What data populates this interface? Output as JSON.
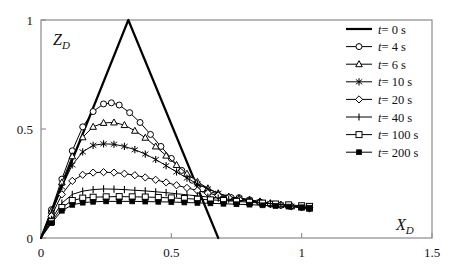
{
  "chart_data": {
    "type": "line",
    "title": "",
    "xlabel": "X_D",
    "ylabel": "Z_D",
    "xlim": [
      0,
      1.5
    ],
    "ylim": [
      0,
      1
    ],
    "xticks": [
      0,
      0.5,
      1,
      1.5
    ],
    "xticklabels": [
      "0",
      "0.5",
      "1",
      "1.5"
    ],
    "yticks": [
      0,
      0.5,
      1
    ],
    "yticklabels": [
      "0",
      "0.5",
      "1"
    ],
    "grid": false,
    "legend_position": "upper right",
    "series": [
      {
        "name": "t=0 s",
        "label": "t = 0 s",
        "marker": "none",
        "color": "#000000",
        "linewidth": 2.2,
        "x": [
          0,
          0.335,
          0.68
        ],
        "y": [
          0,
          1.0,
          0
        ]
      },
      {
        "name": "t=4 s",
        "label": "t = 4 s",
        "marker": "circle",
        "color": "#000000",
        "linewidth": 1.0,
        "x": [
          0,
          0.04,
          0.08,
          0.12,
          0.16,
          0.2,
          0.24,
          0.27,
          0.3,
          0.34,
          0.38,
          0.42,
          0.46,
          0.5,
          0.54,
          0.58,
          0.62,
          0.66,
          0.7,
          0.73,
          0.76,
          0.8,
          0.84,
          0.88,
          0.92,
          0.96,
          1.0,
          1.03
        ],
        "y": [
          0,
          0.13,
          0.27,
          0.4,
          0.51,
          0.58,
          0.615,
          0.62,
          0.61,
          0.575,
          0.53,
          0.475,
          0.42,
          0.365,
          0.31,
          0.265,
          0.225,
          0.195,
          0.18,
          0.185,
          0.185,
          0.175,
          0.165,
          0.155,
          0.15,
          0.145,
          0.14,
          0.135
        ]
      },
      {
        "name": "t=6 s",
        "label": "t = 6 s",
        "marker": "triangle",
        "color": "#000000",
        "linewidth": 1.0,
        "x": [
          0,
          0.04,
          0.08,
          0.12,
          0.16,
          0.2,
          0.24,
          0.28,
          0.32,
          0.36,
          0.4,
          0.44,
          0.48,
          0.52,
          0.56,
          0.6,
          0.64,
          0.68,
          0.72,
          0.76,
          0.8,
          0.84,
          0.88,
          0.92,
          0.96,
          1.0,
          1.03
        ],
        "y": [
          0,
          0.125,
          0.255,
          0.375,
          0.462,
          0.51,
          0.528,
          0.53,
          0.518,
          0.492,
          0.46,
          0.42,
          0.378,
          0.335,
          0.295,
          0.258,
          0.228,
          0.205,
          0.19,
          0.182,
          0.175,
          0.168,
          0.16,
          0.152,
          0.145,
          0.14,
          0.135
        ]
      },
      {
        "name": "t=10 s",
        "label": "t = 10 s",
        "marker": "star",
        "color": "#000000",
        "linewidth": 1.0,
        "x": [
          0,
          0.04,
          0.08,
          0.12,
          0.16,
          0.2,
          0.24,
          0.28,
          0.32,
          0.36,
          0.4,
          0.44,
          0.48,
          0.52,
          0.56,
          0.6,
          0.64,
          0.68,
          0.72,
          0.76,
          0.8,
          0.84,
          0.88,
          0.92,
          0.96,
          1.0,
          1.03
        ],
        "y": [
          0,
          0.115,
          0.235,
          0.335,
          0.395,
          0.425,
          0.432,
          0.43,
          0.42,
          0.405,
          0.385,
          0.36,
          0.332,
          0.303,
          0.275,
          0.248,
          0.225,
          0.205,
          0.19,
          0.18,
          0.172,
          0.165,
          0.158,
          0.152,
          0.146,
          0.14,
          0.135
        ]
      },
      {
        "name": "t=20 s",
        "label": "t = 20 s",
        "marker": "diamond",
        "color": "#000000",
        "linewidth": 1.0,
        "x": [
          0,
          0.04,
          0.08,
          0.12,
          0.16,
          0.2,
          0.24,
          0.28,
          0.32,
          0.36,
          0.4,
          0.44,
          0.48,
          0.52,
          0.56,
          0.6,
          0.64,
          0.68,
          0.72,
          0.76,
          0.8,
          0.84,
          0.88,
          0.92,
          0.96,
          1.0,
          1.03
        ],
        "y": [
          0,
          0.1,
          0.2,
          0.262,
          0.29,
          0.3,
          0.302,
          0.3,
          0.295,
          0.288,
          0.278,
          0.267,
          0.255,
          0.242,
          0.23,
          0.218,
          0.206,
          0.195,
          0.185,
          0.177,
          0.17,
          0.163,
          0.157,
          0.151,
          0.146,
          0.142,
          0.138
        ]
      },
      {
        "name": "t=40 s",
        "label": "t = 40 s",
        "marker": "plus",
        "color": "#000000",
        "linewidth": 1.0,
        "x": [
          0,
          0.04,
          0.08,
          0.12,
          0.16,
          0.2,
          0.24,
          0.28,
          0.32,
          0.36,
          0.4,
          0.44,
          0.48,
          0.52,
          0.56,
          0.6,
          0.64,
          0.68,
          0.72,
          0.76,
          0.8,
          0.84,
          0.88,
          0.92,
          0.96,
          1.0,
          1.03
        ],
        "y": [
          0,
          0.085,
          0.16,
          0.2,
          0.215,
          0.222,
          0.225,
          0.224,
          0.222,
          0.219,
          0.216,
          0.212,
          0.208,
          0.203,
          0.198,
          0.193,
          0.188,
          0.183,
          0.178,
          0.173,
          0.168,
          0.163,
          0.158,
          0.153,
          0.148,
          0.144,
          0.14
        ]
      },
      {
        "name": "t=100 s",
        "label": "t = 100 s",
        "marker": "square",
        "color": "#000000",
        "linewidth": 1.0,
        "x": [
          0,
          0.04,
          0.08,
          0.12,
          0.16,
          0.2,
          0.25,
          0.3,
          0.35,
          0.4,
          0.45,
          0.5,
          0.55,
          0.6,
          0.65,
          0.7,
          0.75,
          0.8,
          0.85,
          0.9,
          0.95,
          1.0,
          1.03
        ],
        "y": [
          0,
          0.075,
          0.14,
          0.172,
          0.183,
          0.187,
          0.189,
          0.19,
          0.189,
          0.188,
          0.186,
          0.184,
          0.181,
          0.178,
          0.175,
          0.172,
          0.168,
          0.164,
          0.16,
          0.156,
          0.152,
          0.148,
          0.145
        ]
      },
      {
        "name": "t=200 s",
        "label": "t = 200 s",
        "marker": "filled-square",
        "color": "#000000",
        "linewidth": 1.0,
        "x": [
          0,
          0.04,
          0.08,
          0.12,
          0.16,
          0.2,
          0.25,
          0.3,
          0.35,
          0.4,
          0.45,
          0.5,
          0.55,
          0.6,
          0.65,
          0.7,
          0.75,
          0.8,
          0.85,
          0.9,
          0.95,
          1.0,
          1.03
        ],
        "y": [
          0,
          0.068,
          0.125,
          0.152,
          0.162,
          0.166,
          0.168,
          0.168,
          0.168,
          0.167,
          0.166,
          0.165,
          0.163,
          0.161,
          0.159,
          0.157,
          0.155,
          0.153,
          0.15,
          0.147,
          0.144,
          0.141,
          0.139
        ]
      }
    ]
  },
  "axes": {
    "x_axis_label": "X",
    "x_axis_sub": "D",
    "y_axis_label": "Z",
    "y_axis_sub": "D"
  },
  "legend": {
    "items": [
      {
        "label": "t = 0 s",
        "marker": "none"
      },
      {
        "label": "t = 4 s",
        "marker": "circle"
      },
      {
        "label": "t = 6 s",
        "marker": "triangle"
      },
      {
        "label": "t = 10 s",
        "marker": "star"
      },
      {
        "label": "t = 20 s",
        "marker": "diamond"
      },
      {
        "label": "t = 40 s",
        "marker": "plus"
      },
      {
        "label": "t = 100 s",
        "marker": "square"
      },
      {
        "label": "t = 200 s",
        "marker": "filled-square"
      }
    ]
  }
}
